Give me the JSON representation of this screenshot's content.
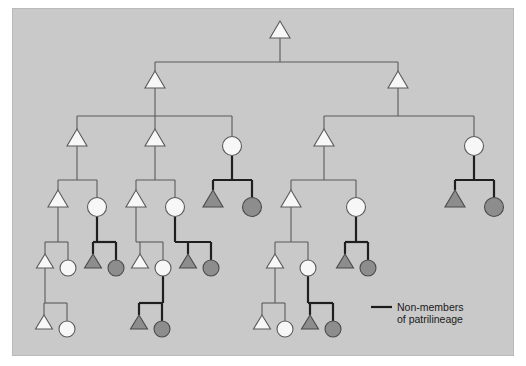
{
  "figure": {
    "type": "kinship-genealogy-diagram",
    "background_color": "#c9c9c9",
    "outer_color": "#ffffff",
    "border_color": "#b9b9b9"
  },
  "legend": {
    "line1": "Non-members",
    "line2": "of patrilineage",
    "swatch_name": "thick-line-swatch",
    "swatch_color": "#1a1a1a",
    "swatch_x1": 371,
    "swatch_x2": 392,
    "swatch_y": 307
  },
  "symbols": {
    "male_shape": "triangle",
    "female_shape": "circle",
    "member_fill": "#f7f7f7",
    "nonmember_fill": "#8d8d8d",
    "member_stroke": "#5a5a5a",
    "nonmember_stroke": "#4a4a4a",
    "thin_line_color": "#5a5a5a",
    "thick_line_color": "#1f1f1f",
    "thin_line_width": 1.1,
    "thick_line_width": 2.2
  },
  "generations": [
    {
      "index": 1,
      "y": 38,
      "label": "G1"
    },
    {
      "index": 2,
      "y": 88,
      "label": "G2"
    },
    {
      "index": 3,
      "y": 146,
      "label": "G3"
    },
    {
      "index": 4,
      "y": 207,
      "label": "G4"
    },
    {
      "index": 5,
      "y": 268,
      "label": "G5"
    },
    {
      "index": 6,
      "y": 329,
      "label": "G6"
    }
  ],
  "nodes": [
    {
      "id": "g1a",
      "gen": 1,
      "sex": "male",
      "member": true,
      "x": 280,
      "y": 38
    },
    {
      "id": "g2a",
      "gen": 2,
      "sex": "male",
      "member": true,
      "x": 155,
      "y": 88
    },
    {
      "id": "g2b",
      "gen": 2,
      "sex": "male",
      "member": true,
      "x": 398,
      "y": 88
    },
    {
      "id": "g3a",
      "gen": 3,
      "sex": "male",
      "member": true,
      "x": 77,
      "y": 146
    },
    {
      "id": "g3b",
      "gen": 3,
      "sex": "male",
      "member": true,
      "x": 155,
      "y": 146
    },
    {
      "id": "g3c",
      "gen": 3,
      "sex": "female",
      "member": true,
      "x": 232,
      "y": 146
    },
    {
      "id": "g3d",
      "gen": 3,
      "sex": "male",
      "member": true,
      "x": 324,
      "y": 146
    },
    {
      "id": "g3e",
      "gen": 3,
      "sex": "female",
      "member": true,
      "x": 474,
      "y": 146
    },
    {
      "id": "g4a",
      "gen": 4,
      "sex": "male",
      "member": true,
      "x": 58,
      "y": 207
    },
    {
      "id": "g4b",
      "gen": 4,
      "sex": "female",
      "member": true,
      "x": 97,
      "y": 207
    },
    {
      "id": "g4c",
      "gen": 4,
      "sex": "male",
      "member": true,
      "x": 136,
      "y": 207
    },
    {
      "id": "g4d",
      "gen": 4,
      "sex": "female",
      "member": true,
      "x": 175,
      "y": 207
    },
    {
      "id": "g4e",
      "gen": 4,
      "sex": "male",
      "member": false,
      "x": 213,
      "y": 207
    },
    {
      "id": "g4f",
      "gen": 4,
      "sex": "female",
      "member": false,
      "x": 252,
      "y": 207
    },
    {
      "id": "g4g",
      "gen": 4,
      "sex": "male",
      "member": true,
      "x": 291,
      "y": 207
    },
    {
      "id": "g4h",
      "gen": 4,
      "sex": "female",
      "member": true,
      "x": 356,
      "y": 207
    },
    {
      "id": "g4i",
      "gen": 4,
      "sex": "male",
      "member": false,
      "x": 455,
      "y": 207
    },
    {
      "id": "g4j",
      "gen": 4,
      "sex": "female",
      "member": false,
      "x": 494,
      "y": 207
    },
    {
      "id": "g5a",
      "gen": 5,
      "sex": "male",
      "member": true,
      "x": 45,
      "y": 268
    },
    {
      "id": "g5b",
      "gen": 5,
      "sex": "female",
      "member": true,
      "x": 68,
      "y": 268
    },
    {
      "id": "g5c",
      "gen": 5,
      "sex": "male",
      "member": false,
      "x": 93,
      "y": 268
    },
    {
      "id": "g5d",
      "gen": 5,
      "sex": "female",
      "member": false,
      "x": 116,
      "y": 268
    },
    {
      "id": "g5e",
      "gen": 5,
      "sex": "male",
      "member": true,
      "x": 140,
      "y": 268
    },
    {
      "id": "g5f",
      "gen": 5,
      "sex": "female",
      "member": true,
      "x": 163,
      "y": 268
    },
    {
      "id": "g5g",
      "gen": 5,
      "sex": "male",
      "member": false,
      "x": 188,
      "y": 268
    },
    {
      "id": "g5h",
      "gen": 5,
      "sex": "female",
      "member": false,
      "x": 211,
      "y": 268
    },
    {
      "id": "g5i",
      "gen": 5,
      "sex": "male",
      "member": true,
      "x": 275,
      "y": 268
    },
    {
      "id": "g5j",
      "gen": 5,
      "sex": "female",
      "member": true,
      "x": 308,
      "y": 268
    },
    {
      "id": "g5k",
      "gen": 5,
      "sex": "male",
      "member": false,
      "x": 345,
      "y": 268
    },
    {
      "id": "g5l",
      "gen": 5,
      "sex": "female",
      "member": false,
      "x": 368,
      "y": 268
    },
    {
      "id": "g6a",
      "gen": 6,
      "sex": "male",
      "member": true,
      "x": 44,
      "y": 329
    },
    {
      "id": "g6b",
      "gen": 6,
      "sex": "female",
      "member": true,
      "x": 67,
      "y": 329
    },
    {
      "id": "g6c",
      "gen": 6,
      "sex": "male",
      "member": false,
      "x": 139,
      "y": 329
    },
    {
      "id": "g6d",
      "gen": 6,
      "sex": "female",
      "member": false,
      "x": 162,
      "y": 329
    },
    {
      "id": "g6e",
      "gen": 6,
      "sex": "male",
      "member": true,
      "x": 262,
      "y": 329
    },
    {
      "id": "g6f",
      "gen": 6,
      "sex": "female",
      "member": true,
      "x": 285,
      "y": 329
    },
    {
      "id": "g6g",
      "gen": 6,
      "sex": "male",
      "member": false,
      "x": 310,
      "y": 329
    },
    {
      "id": "g6h",
      "gen": 6,
      "sex": "female",
      "member": false,
      "x": 333,
      "y": 329
    }
  ],
  "descent_links": [
    {
      "id": "d1",
      "parent": "g1a",
      "children": [
        "g2a",
        "g2b"
      ],
      "bar_y": 62,
      "thick": false
    },
    {
      "id": "d2",
      "parent": "g2a",
      "children": [
        "g3a",
        "g3b",
        "g3c"
      ],
      "bar_y": 116,
      "thick": false
    },
    {
      "id": "d3",
      "parent": "g2b",
      "children": [
        "g3d",
        "g3e"
      ],
      "bar_y": 116,
      "thick": false
    },
    {
      "id": "d4",
      "parent": "g3a",
      "children": [
        "g4a",
        "g4b"
      ],
      "bar_y": 180,
      "thick": false
    },
    {
      "id": "d5",
      "parent": "g3b",
      "children": [
        "g4c",
        "g4d"
      ],
      "bar_y": 180,
      "thick": false
    },
    {
      "id": "d6",
      "parent": "g3c",
      "children": [
        "g4e",
        "g4f"
      ],
      "bar_y": 180,
      "thick": true
    },
    {
      "id": "d7",
      "parent": "g3d",
      "children": [
        "g4g",
        "g4h"
      ],
      "bar_y": 180,
      "thick": false
    },
    {
      "id": "d8",
      "parent": "g3e",
      "children": [
        "g4i",
        "g4j"
      ],
      "bar_y": 180,
      "thick": true
    },
    {
      "id": "d9",
      "parent": "g4a",
      "children": [
        "g5a",
        "g5b"
      ],
      "bar_y": 242,
      "thick": false
    },
    {
      "id": "d10",
      "parent": "g4b",
      "children": [
        "g5c",
        "g5d"
      ],
      "bar_y": 242,
      "thick": true
    },
    {
      "id": "d11",
      "parent": "g4c",
      "children": [
        "g5e",
        "g5f"
      ],
      "bar_y": 242,
      "thick": false
    },
    {
      "id": "d12",
      "parent": "g4d",
      "children": [
        "g5g",
        "g5h"
      ],
      "bar_y": 242,
      "thick": true
    },
    {
      "id": "d13",
      "parent": "g4g",
      "children": [
        "g5i",
        "g5j"
      ],
      "bar_y": 242,
      "thick": false
    },
    {
      "id": "d14",
      "parent": "g4h",
      "children": [
        "g5k",
        "g5l"
      ],
      "bar_y": 242,
      "thick": true
    },
    {
      "id": "d15",
      "parent": "g5a",
      "children": [
        "g6a",
        "g6b"
      ],
      "bar_y": 303,
      "thick": false
    },
    {
      "id": "d16",
      "parent": "g5f",
      "children": [
        "g6c",
        "g6d"
      ],
      "bar_y": 303,
      "thick": true
    },
    {
      "id": "d17",
      "parent": "g5i",
      "children": [
        "g6e",
        "g6f"
      ],
      "bar_y": 303,
      "thick": false
    },
    {
      "id": "d18",
      "parent": "g5j",
      "children": [
        "g6g",
        "g6h"
      ],
      "bar_y": 303,
      "thick": true
    }
  ],
  "counts": {
    "total_nodes": 39,
    "members": 23,
    "non_members": 16,
    "generations": 6
  }
}
